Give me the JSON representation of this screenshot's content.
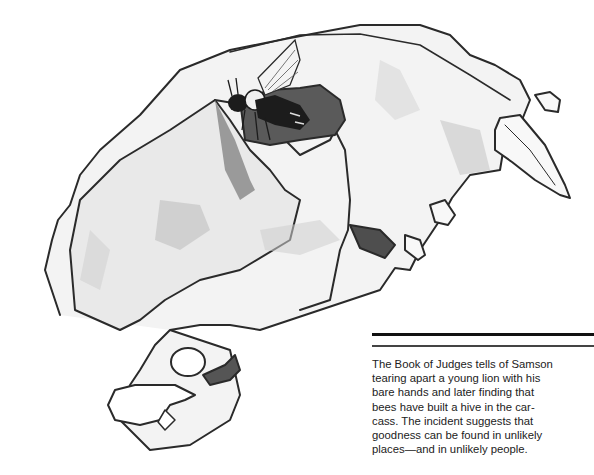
{
  "illustration": {
    "subject": "lion-skull-with-bee",
    "colors": {
      "outline": "#2a2a2a",
      "shade_light": "#e6e6e6",
      "shade_mid": "#bdbdbd",
      "shade_dark": "#555555",
      "bee": "#1c1c1c"
    }
  },
  "caption": {
    "lines": [
      "The Book of Judges tells of Samson",
      "tearing apart a young lion with his",
      "bare hands and later finding that",
      "bees have built a hive in the car-",
      "cass. The incident suggests that",
      "goodness can be found in unlikely",
      "places—and in unlikely people."
    ]
  }
}
